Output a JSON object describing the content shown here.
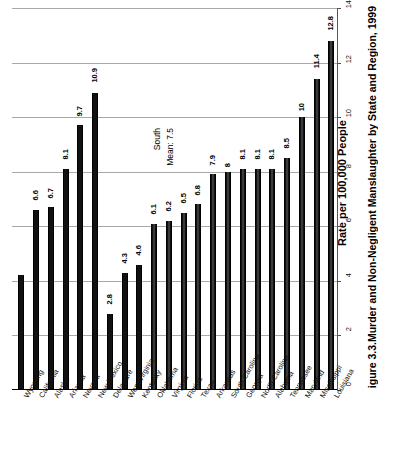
{
  "figure": {
    "caption_number": "igure 3.3.",
    "caption_text": "Murder and Non-Negligent Manslaughter by State and Region, 1999",
    "axis_title": "Rate per 100,000 People"
  },
  "annotation": {
    "line1": "South",
    "line2": "Mean:  7.5"
  },
  "chart_data": {
    "type": "bar",
    "title": "Murder and Non-Negligent Manslaughter by State and Region, 1999",
    "xlabel": "",
    "ylabel": "Rate per 100,000 People",
    "ylim": [
      0,
      14
    ],
    "yticks": [
      "0",
      "2",
      "4",
      "6",
      "8",
      "10",
      "12",
      "14"
    ],
    "grid": true,
    "orientation": "vertical-bars-on-rotated-page",
    "legend": "none",
    "categories": [
      "Wyoming",
      "California",
      "Alaska",
      "Arizona",
      "Nevada",
      "New Mexico",
      "Delaware",
      "West Virginia",
      "Kentucky",
      "Oklahoma",
      "Virginia",
      "Florida",
      "Texas",
      "Arkansas",
      "South Carolina",
      "Georgia",
      "North Carolina",
      "Alabama",
      "Tennessee",
      "Maryland",
      "Mississippi",
      "Louisiana"
    ],
    "values": [
      4.2,
      6.6,
      6.7,
      8.1,
      9.7,
      10.9,
      2.8,
      4.3,
      4.6,
      6.1,
      6.2,
      6.5,
      6.8,
      7.9,
      8,
      8.1,
      8.1,
      8.1,
      8.5,
      10,
      11.4,
      12.8
    ],
    "data_labels": [
      "",
      "6.6",
      "6.7",
      "8.1",
      "9.7",
      "10.9",
      "2.8",
      "4.3",
      "4.6",
      "6.1",
      "6.2",
      "6.5",
      "6.8",
      "7.9",
      "8",
      "8.1",
      "8.1",
      "8.1",
      "8.5",
      "10",
      "11.4",
      "12.8"
    ],
    "groups": [
      {
        "name": "West",
        "start": 0,
        "end": 5
      },
      {
        "name": "South",
        "start": 6,
        "end": 21,
        "mean": 7.5
      }
    ],
    "annotations": [
      {
        "text": "South Mean: 7.5",
        "value": 7.5
      }
    ]
  },
  "colors": {
    "bar": "#111111",
    "gridline": "#a9a9a9",
    "axis": "#555555",
    "text": "#000000",
    "background": "#ffffff"
  }
}
